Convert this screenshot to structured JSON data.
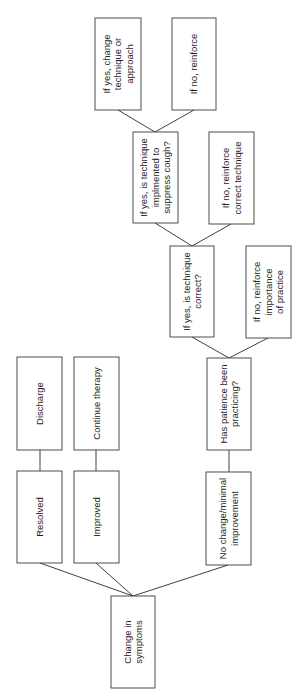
{
  "diagram": {
    "type": "flowchart",
    "orientation": "rotated-90-ccw (reads bottom to top)",
    "colors": {
      "background": "#ffffff",
      "stroke": "#3a3a3a",
      "text": "#1e1e1e"
    },
    "nodes": [
      {
        "id": "change",
        "lines": [
          "Change in",
          "symptoms"
        ],
        "x": 111,
        "y": 596,
        "w": 44,
        "h": 92
      },
      {
        "id": "resolved",
        "lines": [
          "Resolved"
        ],
        "x": 17,
        "y": 471,
        "w": 45,
        "h": 92
      },
      {
        "id": "improved",
        "lines": [
          "Improved"
        ],
        "x": 74,
        "y": 471,
        "w": 45,
        "h": 92
      },
      {
        "id": "discharge",
        "lines": [
          "Discharge"
        ],
        "x": 17,
        "y": 357,
        "w": 45,
        "h": 93
      },
      {
        "id": "continue",
        "lines": [
          "Continue therapy"
        ],
        "x": 74,
        "y": 357,
        "w": 45,
        "h": 93
      },
      {
        "id": "nochange",
        "lines": [
          "No change/minimal",
          "improvement"
        ],
        "x": 206,
        "y": 472,
        "w": 45,
        "h": 93
      },
      {
        "id": "practicing",
        "lines": [
          "Has patience been",
          "practicing?"
        ],
        "x": 207,
        "y": 358,
        "w": 44,
        "h": 92
      },
      {
        "id": "correct",
        "lines": [
          "If yes, is technique",
          "correct?"
        ],
        "x": 170,
        "y": 246,
        "w": 44,
        "h": 91
      },
      {
        "id": "importance",
        "lines": [
          "If no, reinforce",
          "importance",
          "of practice"
        ],
        "x": 246,
        "y": 246,
        "w": 45,
        "h": 92
      },
      {
        "id": "implemented",
        "lines": [
          "If yes, is technique",
          "implmented to",
          "suppress cough?"
        ],
        "x": 133,
        "y": 132,
        "w": 45,
        "h": 91
      },
      {
        "id": "reinforce_technique",
        "lines": [
          "If no, reinforce",
          "correct technique"
        ],
        "x": 209,
        "y": 132,
        "w": 45,
        "h": 92
      },
      {
        "id": "change_technique",
        "lines": [
          "If yes, change",
          "technique or",
          "approach"
        ],
        "x": 95,
        "y": 18,
        "w": 46,
        "h": 92
      },
      {
        "id": "reinforce",
        "lines": [
          "If no, reinforce"
        ],
        "x": 172,
        "y": 18,
        "w": 44,
        "h": 92
      }
    ],
    "edges": [
      {
        "from": "change",
        "to": "resolved",
        "points": [
          [
            133,
            596
          ],
          [
            40,
            563
          ]
        ]
      },
      {
        "from": "change",
        "to": "improved",
        "points": [
          [
            133,
            596
          ],
          [
            96,
            563
          ]
        ]
      },
      {
        "from": "change",
        "to": "nochange",
        "points": [
          [
            133,
            596
          ],
          [
            228,
            565
          ]
        ]
      },
      {
        "from": "resolved",
        "to": "discharge",
        "points": [
          [
            40,
            471
          ],
          [
            40,
            450
          ]
        ]
      },
      {
        "from": "improved",
        "to": "continue",
        "points": [
          [
            96,
            471
          ],
          [
            96,
            450
          ]
        ]
      },
      {
        "from": "nochange",
        "to": "practicing",
        "points": [
          [
            229,
            472
          ],
          [
            229,
            450
          ]
        ]
      },
      {
        "from": "practicing",
        "to": "correct",
        "points": [
          [
            229,
            358
          ],
          [
            192,
            337
          ]
        ]
      },
      {
        "from": "practicing",
        "to": "importance",
        "points": [
          [
            229,
            358
          ],
          [
            268,
            338
          ]
        ]
      },
      {
        "from": "correct",
        "to": "implemented",
        "points": [
          [
            192,
            246
          ],
          [
            155,
            223
          ]
        ]
      },
      {
        "from": "correct",
        "to": "reinforce_technique",
        "points": [
          [
            192,
            246
          ],
          [
            231,
            224
          ]
        ]
      },
      {
        "from": "implemented",
        "to": "change_technique",
        "points": [
          [
            155,
            132
          ],
          [
            118,
            110
          ]
        ]
      },
      {
        "from": "implemented",
        "to": "reinforce",
        "points": [
          [
            155,
            132
          ],
          [
            194,
            110
          ]
        ]
      }
    ]
  }
}
